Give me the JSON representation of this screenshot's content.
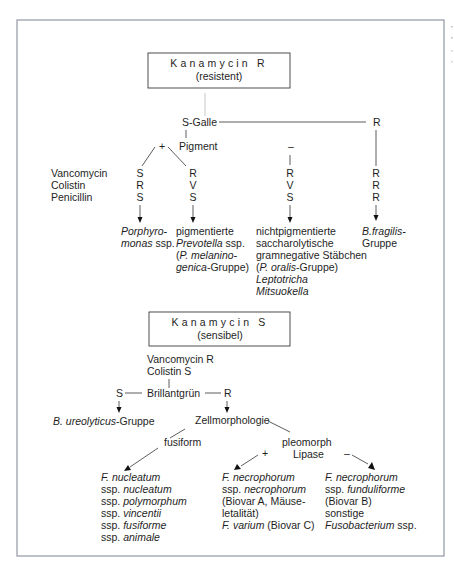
{
  "top": {
    "box": {
      "title": "Kanamycin R",
      "subtitle": "(resistent)"
    },
    "s_galle": {
      "label": "S-Galle",
      "right_result": "R"
    },
    "pigment": {
      "label": "Pigment",
      "plus": "+",
      "minus": "–"
    },
    "antibiotics": [
      "Vancomycin",
      "Colistin",
      "Penicillin"
    ],
    "columns": [
      {
        "values": [
          "S",
          "R",
          "S"
        ],
        "result": [
          {
            "text": "Porphyro-",
            "italic": true
          },
          {
            "parts": [
              {
                "text": "monas",
                "italic": true
              },
              {
                "text": " ssp.",
                "italic": false
              }
            ]
          }
        ]
      },
      {
        "values": [
          "R",
          "V",
          "S"
        ],
        "result": [
          {
            "text": "pigmentierte",
            "italic": false
          },
          {
            "parts": [
              {
                "text": "Prevotella",
                "italic": true
              },
              {
                "text": " ssp.",
                "italic": false
              }
            ]
          },
          {
            "parts": [
              {
                "text": "(",
                "italic": false
              },
              {
                "text": "P. melanino-",
                "italic": true
              }
            ]
          },
          {
            "parts": [
              {
                "text": "genica",
                "italic": true
              },
              {
                "text": "-Gruppe)",
                "italic": false
              }
            ]
          }
        ]
      },
      {
        "values": [
          "R",
          "V",
          "S"
        ],
        "result": [
          {
            "text": "nichtpigmentierte",
            "italic": false
          },
          {
            "text": "saccharolytische",
            "italic": false
          },
          {
            "text": "gramnegative Stäbchen",
            "italic": false
          },
          {
            "parts": [
              {
                "text": "(",
                "italic": false
              },
              {
                "text": "P. oralis",
                "italic": true
              },
              {
                "text": "-Gruppe)",
                "italic": false
              }
            ]
          },
          {
            "text": "Leptotricha",
            "italic": true
          },
          {
            "text": "Mitsuokella",
            "italic": true
          }
        ]
      },
      {
        "values": [
          "R",
          "R",
          "R"
        ],
        "result": [
          {
            "text": "B.fragilis-",
            "italic": true
          },
          {
            "text": "Gruppe",
            "italic": false
          }
        ]
      }
    ]
  },
  "bottom": {
    "box": {
      "title": "Kanamycin S",
      "subtitle": "(sensibel)"
    },
    "conditions": [
      "Vancomycin R",
      "Colistin S"
    ],
    "brillantgruen": {
      "label": "Brillantgrün",
      "left": "S",
      "right": "R"
    },
    "left_result": {
      "parts": [
        {
          "text": "B. ureolyticus",
          "italic": true
        },
        {
          "text": "-Gruppe",
          "italic": false
        }
      ]
    },
    "zellmorphologie": {
      "label": "Zellmorphologie"
    },
    "fusiform": {
      "label": "fusiform"
    },
    "pleomorph": {
      "label": "pleomorph",
      "lipase": "Lipase",
      "plus": "+",
      "minus": "–"
    },
    "results": [
      [
        {
          "text": "F. nucleatum",
          "italic": true
        },
        {
          "parts": [
            {
              "text": "ssp. ",
              "italic": false
            },
            {
              "text": "nucleatum",
              "italic": true
            }
          ]
        },
        {
          "parts": [
            {
              "text": "ssp. ",
              "italic": false
            },
            {
              "text": "polymorphum",
              "italic": true
            }
          ]
        },
        {
          "parts": [
            {
              "text": "ssp. ",
              "italic": false
            },
            {
              "text": "vincentii",
              "italic": true
            }
          ]
        },
        {
          "parts": [
            {
              "text": "ssp. ",
              "italic": false
            },
            {
              "text": "fusiforme",
              "italic": true
            }
          ]
        },
        {
          "parts": [
            {
              "text": "ssp. ",
              "italic": false
            },
            {
              "text": "animale",
              "italic": true
            }
          ]
        }
      ],
      [
        {
          "text": "F. necrophorum",
          "italic": true
        },
        {
          "parts": [
            {
              "text": "ssp. ",
              "italic": false
            },
            {
              "text": "necrophorum",
              "italic": true
            }
          ]
        },
        {
          "text": "(Biovar A, Mäuse-",
          "italic": false
        },
        {
          "text": "letalität)",
          "italic": false
        },
        {
          "parts": [
            {
              "text": "F. varium",
              "italic": true
            },
            {
              "text": " (Biovar C)",
              "italic": false
            }
          ]
        }
      ],
      [
        {
          "text": "F. necrophorum",
          "italic": true
        },
        {
          "parts": [
            {
              "text": "ssp. ",
              "italic": false
            },
            {
              "text": "funduliforme",
              "italic": true
            }
          ]
        },
        {
          "text": "(Biovar B)",
          "italic": false
        },
        {
          "text": "sonstige",
          "italic": false
        },
        {
          "parts": [
            {
              "text": "Fusobacterium",
              "italic": true
            },
            {
              "text": " ssp.",
              "italic": false
            }
          ]
        }
      ]
    ]
  }
}
